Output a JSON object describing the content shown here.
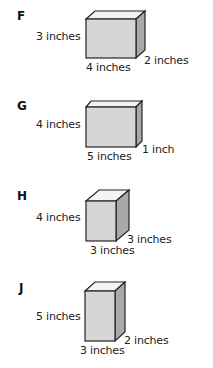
{
  "options": [
    {
      "letter": "F",
      "height_label": "3 inches",
      "width_label": "4 inches",
      "depth_label": "2 inches",
      "dims": {
        "height": 3,
        "width": 4,
        "depth": 2
      }
    },
    {
      "letter": "G",
      "height_label": "4 inches",
      "width_label": "5 inches",
      "depth_label": "1 inch",
      "dims": {
        "height": 4,
        "width": 5,
        "depth": 1
      }
    },
    {
      "letter": "H",
      "height_label": "4 inches",
      "width_label": "3 inches",
      "depth_label": "3 inches",
      "dims": {
        "height": 4,
        "width": 3,
        "depth": 3
      }
    },
    {
      "letter": "J",
      "height_label": "5 inches",
      "width_label": "3 inches",
      "depth_label": "2 inches",
      "dims": {
        "height": 5,
        "width": 3,
        "depth": 2
      }
    }
  ],
  "colors": {
    "front_face": "#d6d6d6",
    "top_face": "#f4f4f4",
    "side_face": "#a9a9a9",
    "edge": "#222222"
  }
}
